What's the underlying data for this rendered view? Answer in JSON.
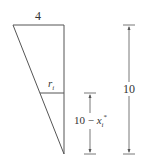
{
  "diagram": {
    "labels": {
      "top_width": "4",
      "slice_radius": "r",
      "slice_radius_sub": "i",
      "lower_dim_prefix": "10 − ",
      "lower_dim_var": "x",
      "lower_dim_sub": "i",
      "lower_dim_sup": "*",
      "total_height": "10"
    },
    "colors": {
      "line": "#555555",
      "text": "#333333",
      "background": "#ffffff"
    }
  }
}
